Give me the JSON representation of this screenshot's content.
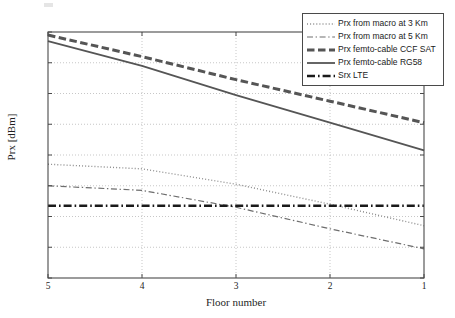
{
  "chart_data": {
    "type": "line",
    "title": "",
    "xlabel": "Floor number",
    "ylabel": "Prx [dBm]",
    "x": [
      5,
      4,
      3,
      2,
      1
    ],
    "xtick_labels": [
      "5",
      "4",
      "3",
      "2",
      "1"
    ],
    "ytick_labels": [
      "-50",
      "-60",
      "-70",
      "-80",
      "-90",
      "-100",
      "-110",
      "-120",
      "-130"
    ],
    "yticks": [
      -50,
      -60,
      -70,
      -80,
      -90,
      -100,
      -110,
      -120,
      -130
    ],
    "xlim": [
      5,
      1
    ],
    "ylim": [
      -130,
      -50
    ],
    "grid": true,
    "legend_position": "top-right",
    "series": [
      {
        "name": "Prx from macro at 3 Km",
        "style": "dotted",
        "color": "#8c8c8c",
        "width": 1.4,
        "values": [
          -93.0,
          -94.5,
          -99.5,
          -106.0,
          -113.0
        ]
      },
      {
        "name": "Prx from macro at 5 Km",
        "style": "dashdot-thin",
        "color": "#6e6e6e",
        "width": 1.2,
        "values": [
          -100.0,
          -101.5,
          -107.0,
          -114.0,
          -120.5
        ]
      },
      {
        "name": "Prx femto-cable CCF SAT",
        "style": "dashed-thick",
        "color": "#555555",
        "width": 3.0,
        "values": [
          -51.0,
          -58.0,
          -65.5,
          -72.5,
          -79.5
        ]
      },
      {
        "name": "Prx femto-cable RG58",
        "style": "solid",
        "color": "#555555",
        "width": 1.8,
        "values": [
          -53.0,
          -61.0,
          -70.5,
          -79.5,
          -88.5
        ]
      },
      {
        "name": "Srx LTE",
        "style": "dashdot-thick",
        "color": "#1a1a1a",
        "width": 2.4,
        "values": [
          -106.5,
          -106.5,
          -106.5,
          -106.5,
          -106.5
        ]
      }
    ]
  },
  "axes": {
    "frame_color": "#4a4a4a",
    "grid_color": "#b9b9b9"
  },
  "legend": {
    "entries": [
      "Prx from macro at 3 Km",
      "Prx from macro at 5 Km",
      "Prx femto-cable CCF SAT",
      "Prx femto-cable RG58",
      "Srx LTE"
    ]
  }
}
